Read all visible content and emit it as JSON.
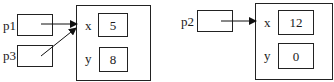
{
  "diagram": {
    "left": {
      "references": [
        {
          "name": "p1"
        },
        {
          "name": "p3"
        }
      ],
      "object": {
        "fields": [
          {
            "name": "x",
            "value": "5"
          },
          {
            "name": "y",
            "value": "8"
          }
        ]
      }
    },
    "right": {
      "references": [
        {
          "name": "p2"
        }
      ],
      "object": {
        "fields": [
          {
            "name": "x",
            "value": "12"
          },
          {
            "name": "y",
            "value": "0"
          }
        ]
      }
    },
    "colors": {
      "stroke": "#222222",
      "background": "#ffffff"
    }
  }
}
